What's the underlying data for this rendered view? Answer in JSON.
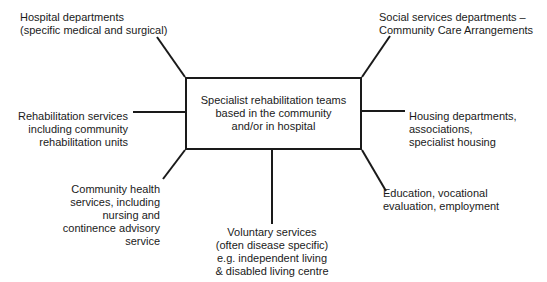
{
  "diagram": {
    "center": {
      "lines": [
        "Specialist rehabilitation teams",
        "based in the community",
        "and/or in hospital"
      ]
    },
    "nodes": {
      "hospital": {
        "lines": [
          "Hospital departments",
          "(specific medical and surgical)"
        ]
      },
      "social": {
        "lines": [
          "Social services departments –",
          "Community Care Arrangements"
        ]
      },
      "rehab": {
        "lines": [
          "Rehabilitation services",
          "including community",
          "rehabilitation units"
        ]
      },
      "housing": {
        "lines": [
          "Housing departments,",
          "associations,",
          "specialist housing"
        ]
      },
      "community": {
        "lines": [
          "Community health",
          "services, including",
          "nursing and",
          "continence advisory",
          "service"
        ]
      },
      "education": {
        "lines": [
          "Education, vocational",
          "evaluation, employment"
        ]
      },
      "voluntary": {
        "lines": [
          "Voluntary services",
          "(often disease specific)",
          "e.g. independent living",
          "& disabled living centre"
        ]
      }
    },
    "colors": {
      "line": "#1a1a1a",
      "background": "#ffffff"
    }
  }
}
